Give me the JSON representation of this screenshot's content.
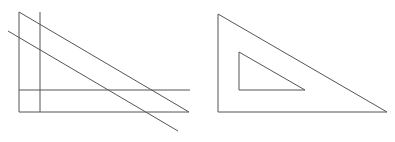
{
  "canvas": {
    "width": 395,
    "height": 142,
    "background": "#ffffff",
    "stroke": "#555555"
  },
  "figures": {
    "left": {
      "description": "lines forming right triangle with parallel and perpendicular lines",
      "lines": [
        {
          "x1": 19,
          "y1": 12,
          "x2": 19,
          "y2": 112
        },
        {
          "x1": 40,
          "y1": 12,
          "x2": 40,
          "y2": 112
        },
        {
          "x1": 19,
          "y1": 90,
          "x2": 190,
          "y2": 90
        },
        {
          "x1": 19,
          "y1": 112,
          "x2": 189,
          "y2": 112
        },
        {
          "x1": 19,
          "y1": 12,
          "x2": 189,
          "y2": 112
        },
        {
          "x1": 8,
          "y1": 31,
          "x2": 178,
          "y2": 131
        }
      ]
    },
    "right": {
      "description": "set square: right triangle with inner triangular cutout",
      "outer": "218,14 218,112 387,112",
      "inner": "239,52 239,90 305,90"
    }
  }
}
